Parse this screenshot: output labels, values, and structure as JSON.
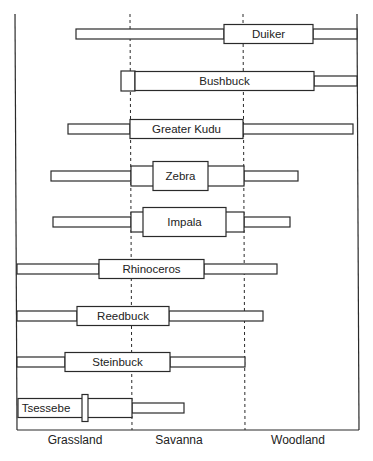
{
  "chart_data": {
    "type": "range-bar",
    "title": "",
    "xlabel": "",
    "ylabel": "",
    "grid": false,
    "legend": "none",
    "x_axis": {
      "categories": [
        "Grassland",
        "Savanna",
        "Woodland"
      ],
      "note": "Habitat gradient; dashed dividers separate Grassland | Savanna | Woodland"
    },
    "series": [
      {
        "name": "Duiker",
        "segments": [
          {
            "x0": 76,
            "x1": 224,
            "weight": "thin"
          },
          {
            "x0": 224,
            "x1": 313,
            "weight": "thick",
            "labelled": true
          },
          {
            "x0": 313,
            "x1": 357,
            "weight": "thin"
          }
        ],
        "habitat_main": "Savanna-Woodland boundary",
        "y": 34
      },
      {
        "name": "Bushbuck",
        "segments": [
          {
            "x0": 121,
            "x1": 135,
            "weight": "medium"
          },
          {
            "x0": 135,
            "x1": 314,
            "weight": "thick",
            "labelled": true
          },
          {
            "x0": 314,
            "x1": 357,
            "weight": "thin"
          }
        ],
        "habitat_main": "Savanna to Woodland",
        "y": 81
      },
      {
        "name": "Greater Kudu",
        "segments": [
          {
            "x0": 68,
            "x1": 130,
            "weight": "thin"
          },
          {
            "x0": 130,
            "x1": 243,
            "weight": "thick",
            "labelled": true
          },
          {
            "x0": 243,
            "x1": 353,
            "weight": "thin"
          }
        ],
        "habitat_main": "Savanna",
        "y": 129
      },
      {
        "name": "Zebra",
        "segments": [
          {
            "x0": 51,
            "x1": 131,
            "weight": "thin"
          },
          {
            "x0": 131,
            "x1": 244,
            "weight": "medium"
          },
          {
            "x0": 153,
            "x1": 208,
            "weight": "thickest",
            "labelled": true
          },
          {
            "x0": 244,
            "x1": 298,
            "weight": "thin"
          }
        ],
        "habitat_main": "Savanna",
        "y": 176
      },
      {
        "name": "Impala",
        "segments": [
          {
            "x0": 53,
            "x1": 131,
            "weight": "thin"
          },
          {
            "x0": 131,
            "x1": 244,
            "weight": "medium"
          },
          {
            "x0": 143,
            "x1": 226,
            "weight": "thickest",
            "labelled": true
          },
          {
            "x0": 244,
            "x1": 290,
            "weight": "thin"
          }
        ],
        "habitat_main": "Savanna",
        "y": 222
      },
      {
        "name": "Rhinoceros",
        "segments": [
          {
            "x0": 17,
            "x1": 99,
            "weight": "thin"
          },
          {
            "x0": 99,
            "x1": 204,
            "weight": "thick",
            "labelled": true
          },
          {
            "x0": 204,
            "x1": 277,
            "weight": "thin"
          }
        ],
        "habitat_main": "Grassland-Savanna boundary",
        "y": 269
      },
      {
        "name": "Reedbuck",
        "segments": [
          {
            "x0": 17,
            "x1": 77,
            "weight": "thin"
          },
          {
            "x0": 77,
            "x1": 169,
            "weight": "thick",
            "labelled": true
          },
          {
            "x0": 169,
            "x1": 263,
            "weight": "thin"
          }
        ],
        "habitat_main": "Grassland-Savanna boundary",
        "y": 316
      },
      {
        "name": "Steinbuck",
        "segments": [
          {
            "x0": 17,
            "x1": 65,
            "weight": "thin"
          },
          {
            "x0": 65,
            "x1": 170,
            "weight": "thick",
            "labelled": true
          },
          {
            "x0": 170,
            "x1": 245,
            "weight": "thin"
          }
        ],
        "habitat_main": "Grassland-Savanna boundary",
        "y": 362
      },
      {
        "name": "Tsessebe",
        "segments": [
          {
            "x0": 18,
            "x1": 132,
            "weight": "thick",
            "labelled": true,
            "label_x": 46
          },
          {
            "x0": 82,
            "x1": 88,
            "weight": "marker"
          },
          {
            "x0": 132,
            "x1": 184,
            "weight": "thin"
          }
        ],
        "habitat_main": "Grassland",
        "y": 408
      }
    ],
    "frame": {
      "left": 15,
      "right": 359,
      "top": 14,
      "bottom": 430
    },
    "dividers": [
      131,
      244
    ]
  },
  "axis_labels": {
    "grassland": "Grassland",
    "savanna": "Savanna",
    "woodland": "Woodland"
  }
}
